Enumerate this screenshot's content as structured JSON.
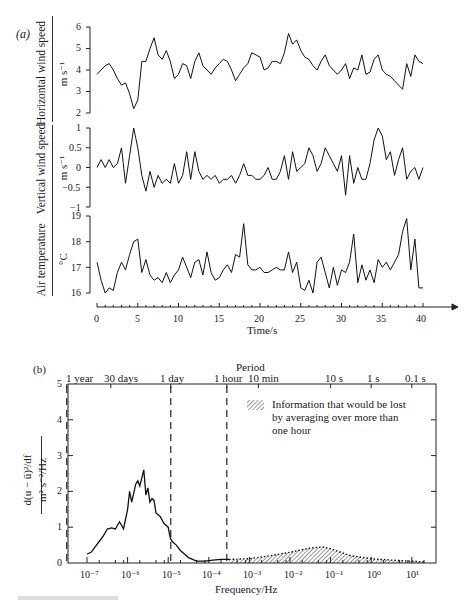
{
  "chart_data": [
    {
      "panel": "(a)",
      "type": "line",
      "title": "",
      "xlabel": "Time/s",
      "xlim": [
        0,
        40
      ],
      "x_ticks": [
        "0",
        "5",
        "10",
        "15",
        "20",
        "25",
        "30",
        "35",
        "40"
      ],
      "subplots": [
        {
          "ylabel": "Horizontal wind speed",
          "yunit": "m s⁻¹",
          "ylim": [
            2,
            6
          ],
          "y_ticks": [
            "2",
            "3",
            "4",
            "5",
            "6"
          ],
          "x": [
            0,
            0.5,
            1,
            1.5,
            2,
            2.5,
            3,
            3.5,
            4,
            4.5,
            5,
            5.5,
            6,
            6.5,
            7,
            7.5,
            8,
            8.5,
            9,
            9.5,
            10,
            10.5,
            11,
            11.5,
            12,
            12.5,
            13,
            13.5,
            14,
            14.5,
            15,
            15.5,
            16,
            16.5,
            17,
            17.5,
            18,
            18.5,
            19,
            19.5,
            20,
            20.5,
            21,
            21.5,
            22,
            22.5,
            23,
            23.5,
            24,
            24.5,
            25,
            25.5,
            26,
            26.5,
            27,
            27.5,
            28,
            28.5,
            29,
            29.5,
            30,
            30.5,
            31,
            31.5,
            32,
            32.5,
            33,
            33.5,
            34,
            34.5,
            35,
            35.5,
            36,
            36.5,
            37,
            37.5,
            38,
            38.5,
            39,
            39.5,
            40
          ],
          "values": [
            3.8,
            4.0,
            4.2,
            4.3,
            4.0,
            3.6,
            3.3,
            3.4,
            2.9,
            2.2,
            2.6,
            4.4,
            4.4,
            5.0,
            5.5,
            4.7,
            4.5,
            4.9,
            4.4,
            3.6,
            3.8,
            4.3,
            4.2,
            3.6,
            4.4,
            4.8,
            4.2,
            4.0,
            3.8,
            4.1,
            4.3,
            4.5,
            4.4,
            4.0,
            3.5,
            3.8,
            4.1,
            4.3,
            4.8,
            4.7,
            4.6,
            4.0,
            4.1,
            4.4,
            4.4,
            4.3,
            4.8,
            5.7,
            5.2,
            5.4,
            4.9,
            4.6,
            4.5,
            4.2,
            4.0,
            4.4,
            4.7,
            4.2,
            4.0,
            3.8,
            4.0,
            4.3,
            3.6,
            4.1,
            4.0,
            4.7,
            3.8,
            3.9,
            4.5,
            4.7,
            4.0,
            3.8,
            3.7,
            3.5,
            3.3,
            3.1,
            4.3,
            3.7,
            4.7,
            4.4,
            4.3
          ]
        },
        {
          "ylabel": "Vertical wind speed",
          "yunit": "m s⁻¹",
          "ylim": [
            -1,
            1
          ],
          "y_ticks": [
            "−1",
            "−0.5",
            "0",
            "0.5",
            "1"
          ],
          "x": [
            0,
            0.5,
            1,
            1.5,
            2,
            2.5,
            3,
            3.5,
            4,
            4.5,
            5,
            5.5,
            6,
            6.5,
            7,
            7.5,
            8,
            8.5,
            9,
            9.5,
            10,
            10.5,
            11,
            11.5,
            12,
            12.5,
            13,
            13.5,
            14,
            14.5,
            15,
            15.5,
            16,
            16.5,
            17,
            17.5,
            18,
            18.5,
            19,
            19.5,
            20,
            20.5,
            21,
            21.5,
            22,
            22.5,
            23,
            23.5,
            24,
            24.5,
            25,
            25.5,
            26,
            26.5,
            27,
            27.5,
            28,
            28.5,
            29,
            29.5,
            30,
            30.5,
            31,
            31.5,
            32,
            32.5,
            33,
            33.5,
            34,
            34.5,
            35,
            35.5,
            36,
            36.5,
            37,
            37.5,
            38,
            38.5,
            39,
            39.5,
            40
          ],
          "values": [
            0.0,
            0.2,
            0.0,
            0.2,
            0.0,
            0.1,
            0.5,
            -0.4,
            0.3,
            1.0,
            0.5,
            -0.2,
            -0.6,
            -0.1,
            -0.5,
            -0.2,
            -0.4,
            -0.3,
            -0.4,
            0.1,
            -0.4,
            -0.2,
            0.4,
            -0.3,
            0.4,
            -0.1,
            -0.3,
            -0.2,
            -0.3,
            -0.2,
            -0.4,
            -0.3,
            -0.3,
            -0.2,
            -0.4,
            -0.2,
            0.1,
            -0.2,
            -0.2,
            -0.3,
            -0.3,
            -0.2,
            0.0,
            -0.3,
            -0.3,
            -0.1,
            0.3,
            -0.3,
            0.4,
            -0.1,
            0.0,
            0.1,
            0.5,
            0.3,
            -0.1,
            0.1,
            0.5,
            0.3,
            0.1,
            -0.1,
            0.3,
            -0.7,
            0.3,
            -0.4,
            0.0,
            -0.3,
            -0.3,
            0.1,
            0.7,
            1.0,
            0.8,
            0.2,
            0.4,
            -0.2,
            0.2,
            0.5,
            -0.3,
            -0.1,
            0.0,
            -0.3,
            0.0
          ]
        },
        {
          "ylabel": "Air temperature",
          "yunit": "°C",
          "ylim": [
            16,
            19
          ],
          "y_ticks": [
            "16",
            "17",
            "18",
            "19"
          ],
          "x": [
            0,
            0.5,
            1,
            1.5,
            2,
            2.5,
            3,
            3.5,
            4,
            4.5,
            5,
            5.5,
            6,
            6.5,
            7,
            7.5,
            8,
            8.5,
            9,
            9.5,
            10,
            10.5,
            11,
            11.5,
            12,
            12.5,
            13,
            13.5,
            14,
            14.5,
            15,
            15.5,
            16,
            16.5,
            17,
            17.5,
            18,
            18.5,
            19,
            19.5,
            20,
            20.5,
            21,
            21.5,
            22,
            22.5,
            23,
            23.5,
            24,
            24.5,
            25,
            25.5,
            26,
            26.5,
            27,
            27.5,
            28,
            28.5,
            29,
            29.5,
            30,
            30.5,
            31,
            31.5,
            32,
            32.5,
            33,
            33.5,
            34,
            34.5,
            35,
            35.5,
            36,
            36.5,
            37,
            37.5,
            38,
            38.5,
            39,
            39.5,
            40
          ],
          "values": [
            17.2,
            16.5,
            16.0,
            16.2,
            16.1,
            16.8,
            17.2,
            16.9,
            17.5,
            18.0,
            18.1,
            16.8,
            17.3,
            16.7,
            16.5,
            16.6,
            16.4,
            16.8,
            16.4,
            16.7,
            16.9,
            17.4,
            17.0,
            16.6,
            17.2,
            17.3,
            16.7,
            17.6,
            16.8,
            16.5,
            16.6,
            16.9,
            17.1,
            16.8,
            17.5,
            17.4,
            18.7,
            17.1,
            16.9,
            16.9,
            17.0,
            16.8,
            16.8,
            16.9,
            17.0,
            16.9,
            16.9,
            17.6,
            16.8,
            17.2,
            16.2,
            16.1,
            16.5,
            16.0,
            17.2,
            17.4,
            16.8,
            16.2,
            17.0,
            16.3,
            16.9,
            16.8,
            17.2,
            18.3,
            16.4,
            17.1,
            16.5,
            16.9,
            16.4,
            17.3,
            17.0,
            17.2,
            16.9,
            17.2,
            17.5,
            18.4,
            18.9,
            16.9,
            18.1,
            16.2,
            16.2
          ]
        }
      ]
    },
    {
      "panel": "(b)",
      "type": "area",
      "title": "",
      "xlabel": "Frequency/Hz",
      "ylabel": "d(u − ū)²/df",
      "yunit": "m² s⁻²/Hz",
      "xscale": "log",
      "xlim_log10": [
        -7.5,
        11.6
      ],
      "x_ticks": [
        "10⁻⁷",
        "10⁻⁶",
        "10⁻⁵",
        "10⁻⁴",
        "10⁻³",
        "10⁻²",
        "10⁻¹",
        "10⁰",
        "10¹"
      ],
      "ylim": [
        0,
        5
      ],
      "y_ticks": [
        "0",
        "1",
        "2",
        "3",
        "4",
        "5"
      ],
      "top_axis_title": "Period",
      "top_ticks": [
        "1 year",
        "30 days",
        "1 day",
        "1 hour",
        "10 min",
        "10 s",
        "1 s",
        "0.1 s"
      ],
      "dashed_lines_at_period": [
        "1 year",
        "1 day",
        "1 hour"
      ],
      "series": [
        {
          "name": "Spectrum (low frequency)",
          "log10_f": [
            -7.0,
            -6.9,
            -6.8,
            -6.7,
            -6.6,
            -6.5,
            -6.4,
            -6.3,
            -6.2,
            -6.1,
            -6.0,
            -5.95,
            -5.9,
            -5.8,
            -5.75,
            -5.7,
            -5.6,
            -5.55,
            -5.5,
            -5.45,
            -5.4,
            -5.35,
            -5.3,
            -5.2,
            -5.1,
            -5.0,
            -4.95,
            -4.9,
            -4.8,
            -4.7,
            -4.6,
            -4.5,
            -4.3,
            -4.1,
            -3.9,
            -3.7,
            -3.5
          ],
          "values": [
            0.25,
            0.3,
            0.45,
            0.6,
            0.75,
            0.95,
            0.98,
            0.95,
            1.15,
            0.95,
            1.5,
            2.0,
            1.7,
            2.2,
            2.3,
            2.15,
            2.6,
            1.9,
            2.1,
            1.7,
            1.8,
            1.75,
            1.4,
            1.3,
            1.1,
            1.0,
            0.7,
            0.6,
            0.5,
            0.35,
            0.25,
            0.15,
            0.05,
            0.05,
            0.08,
            0.1,
            0.1
          ]
        },
        {
          "name": "Information that would be lost by averaging over more than one hour",
          "style": "hatched, dotted outline",
          "log10_f": [
            -3.5,
            -3.0,
            -2.5,
            -2.0,
            -1.5,
            -1.2,
            -1.0,
            -0.5,
            0.0,
            0.5,
            1.0,
            1.3
          ],
          "values": [
            0.1,
            0.12,
            0.2,
            0.3,
            0.42,
            0.45,
            0.4,
            0.2,
            0.12,
            0.08,
            0.05,
            0.03
          ]
        }
      ],
      "legend": {
        "position": "upper right (inside plot)",
        "text": "Information that would be lost by averaging over more than one hour",
        "symbol": "hatched box"
      }
    }
  ],
  "panel_a": {
    "label": "(a)",
    "subplots": [
      {
        "ylabel": "Horizontal wind speed",
        "yunit": "m s⁻¹",
        "ticks": [
          "6",
          "5",
          "4",
          "3",
          "2"
        ]
      },
      {
        "ylabel": "Vertical wind speed",
        "yunit": "m s⁻¹",
        "ticks": [
          "1",
          "0.5",
          "0",
          "−0.5",
          "−1"
        ]
      },
      {
        "ylabel": "Air temperature",
        "yunit": "°C",
        "ticks": [
          "19",
          "18",
          "17",
          "16"
        ]
      }
    ],
    "x_ticks": [
      "0",
      "5",
      "10",
      "15",
      "20",
      "25",
      "30",
      "35",
      "40"
    ],
    "xlabel": "Time/s"
  },
  "panel_b": {
    "label": "(b)",
    "top_title": "Period",
    "top_ticks": [
      "1 year",
      "30 days",
      "1 day",
      "1 hour",
      "10 min",
      "10 s",
      "1 s",
      "0.1 s"
    ],
    "y_ticks": [
      "5",
      "4",
      "3",
      "2",
      "1",
      "0"
    ],
    "ylabel_num": "d(u − ū)²/df",
    "ylabel_den": "m² s⁻²/Hz",
    "x_ticks": [
      "10⁻⁷",
      "10⁻⁶",
      "10⁻⁵",
      "10⁻⁴",
      "10⁻³",
      "10⁻²",
      "10⁻¹",
      "10⁰",
      "10¹"
    ],
    "xlabel": "Frequency/Hz",
    "legend_text": "Information that would be lost by averaging over more than one hour"
  }
}
